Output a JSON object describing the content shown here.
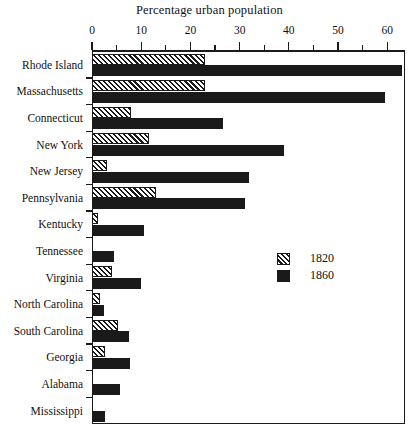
{
  "chart_data": {
    "type": "bar",
    "orientation": "horizontal",
    "title": "Percentage urban population",
    "xlabel": "",
    "ylabel": "",
    "xlim": [
      0,
      63.5
    ],
    "xticks": [
      0,
      10,
      20,
      30,
      40,
      50,
      60
    ],
    "xtick_labels": [
      "0",
      "10",
      "20",
      "30",
      "40",
      "50",
      "60"
    ],
    "minor_tick_step": 5,
    "grid": false,
    "legend_position": "middle-right",
    "categories": [
      "Rhode Island",
      "Massachusetts",
      "Connecticut",
      "New York",
      "New Jersey",
      "Pennsylvania",
      "Kentucky",
      "Tennessee",
      "Virginia",
      "North Carolina",
      "South Carolina",
      "Georgia",
      "Alabama",
      "Mississippi"
    ],
    "series": [
      {
        "name": "1820",
        "fill": "hatched",
        "color": "#1a1a1a",
        "values": [
          23.0,
          23.0,
          8.0,
          11.5,
          3.0,
          13.0,
          1.2,
          0.0,
          4.0,
          1.6,
          5.3,
          2.7,
          0.0,
          0.0
        ]
      },
      {
        "name": "1860",
        "fill": "solid",
        "color": "#1a1a1a",
        "values": [
          63.0,
          59.5,
          26.7,
          39.0,
          32.0,
          31.0,
          10.5,
          4.5,
          10.0,
          2.5,
          7.5,
          7.7,
          5.6,
          2.6
        ]
      }
    ]
  },
  "legend": {
    "entries": [
      {
        "label": "1820",
        "swatch": "hatched"
      },
      {
        "label": "1860",
        "swatch": "solid"
      }
    ]
  },
  "colors": {
    "ink": "#1a1a1a",
    "background": "#ffffff"
  },
  "caption_fragment": ""
}
